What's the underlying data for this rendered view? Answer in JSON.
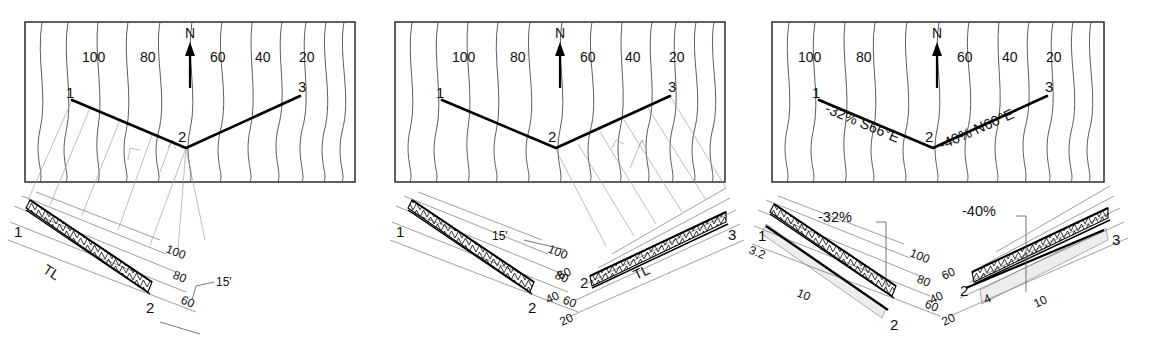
{
  "figure": {
    "panels": [
      "panel-1",
      "panel-2",
      "panel-3"
    ]
  },
  "map_common": {
    "north_label": "N",
    "contour_labels": [
      "100",
      "80",
      "60",
      "40",
      "20"
    ],
    "station_labels": [
      "1",
      "2",
      "3"
    ],
    "contour_interval": 20,
    "elevation_high": 100,
    "elevation_low": 20
  },
  "panel1": {
    "map": {
      "north_label": "N",
      "contours": [
        "100",
        "80",
        "60",
        "40",
        "20"
      ],
      "points": [
        "1",
        "2",
        "3"
      ]
    },
    "profile": {
      "point_start": "1",
      "point_end": "2",
      "true_length_label": "TL",
      "elevation_ticks": [
        "100",
        "80",
        "60"
      ],
      "dimension": "15'"
    }
  },
  "panel2": {
    "map": {
      "north_label": "N",
      "contours": [
        "100",
        "80",
        "60",
        "40",
        "20"
      ],
      "points": [
        "1",
        "2",
        "3"
      ]
    },
    "profile_left": {
      "point_start": "1",
      "point_end": "2",
      "elevation_ticks": [
        "100",
        "80",
        "60"
      ],
      "dimension": "15'"
    },
    "profile_right": {
      "point_start": "2",
      "point_end": "3",
      "true_length_label": "TL",
      "elevation_ticks": [
        "60",
        "40",
        "20"
      ]
    }
  },
  "panel3": {
    "map": {
      "north_label": "N",
      "contours": [
        "100",
        "80",
        "60",
        "40",
        "20"
      ],
      "points": [
        "1",
        "2",
        "3"
      ],
      "leg1_annotation": "-32%  S66°E",
      "leg1_point": "1",
      "leg2_annotation": "-40% N60°E",
      "leg2_point": "3",
      "vertex_point": "2"
    },
    "profile_left": {
      "grade_label": "-32%",
      "point_start": "1",
      "point_end": "2",
      "rise_label": "3.2",
      "run_label": "10",
      "elevation_ticks": [
        "100",
        "80",
        "60"
      ]
    },
    "profile_right": {
      "grade_label": "-40%",
      "point_start": "2",
      "point_end": "3",
      "rise_label": "4",
      "run_label": "10",
      "elevation_ticks": [
        "60",
        "40",
        "20"
      ]
    }
  },
  "colors": {
    "ink": "#111111",
    "contour": "#4a4a4a",
    "construction": "#9a9a9a",
    "shade": "#000000"
  }
}
